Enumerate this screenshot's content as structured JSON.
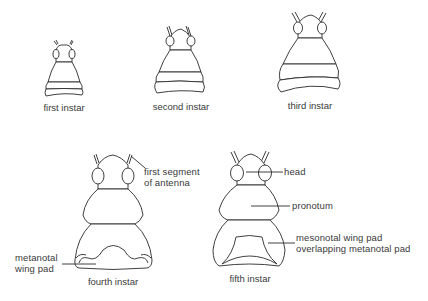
{
  "figure": {
    "instars": [
      {
        "id": "first",
        "caption": "first instar"
      },
      {
        "id": "second",
        "caption": "second instar"
      },
      {
        "id": "third",
        "caption": "third instar"
      },
      {
        "id": "fourth",
        "caption": "fourth instar"
      },
      {
        "id": "fifth",
        "caption": "fifth instar"
      }
    ],
    "labels": {
      "first_segment_line1": "first segment",
      "first_segment_line2": "of antenna",
      "metanotal_line1": "metanotal",
      "metanotal_line2": "wing pad",
      "head": "head",
      "pronotum": "pronotum",
      "mesonotal_line1": "mesonotal wing pad",
      "mesonotal_line2": "overlapping metanotal pad"
    },
    "colors": {
      "stroke": "#2a2a2a",
      "text": "#3a3a3a",
      "background": "#ffffff"
    }
  }
}
